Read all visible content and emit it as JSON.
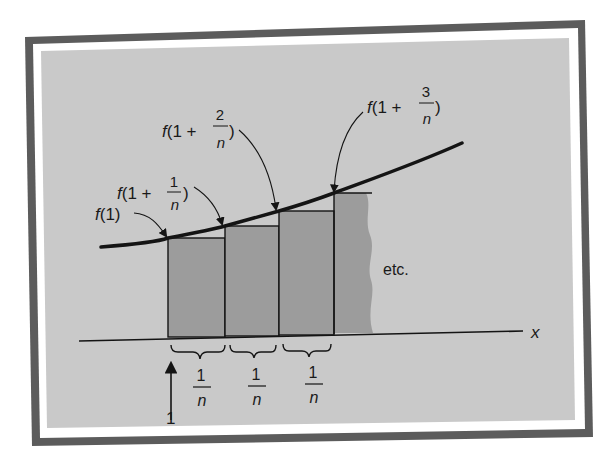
{
  "figure": {
    "colors": {
      "frame": "#5c5c5c",
      "mat": "#ffffff",
      "background": "#c9c9c9",
      "rect_fill": "#9c9c9c",
      "ink": "#141414"
    },
    "labels": {
      "f1": {
        "prefix": "f(1)"
      },
      "f1_plus_1n": {
        "prefix": "f(1 +",
        "num": "1",
        "den": "n",
        "suffix": ")"
      },
      "f1_plus_2n": {
        "prefix": "f(1 +",
        "num": "2",
        "den": "n",
        "suffix": ")"
      },
      "f1_plus_3n": {
        "prefix": "f(1 +",
        "num": "3",
        "den": "n",
        "suffix": ")"
      },
      "etc": "etc.",
      "x_axis": "x",
      "start": "1"
    },
    "widths": [
      {
        "num": "1",
        "den": "n"
      },
      {
        "num": "1",
        "den": "n"
      },
      {
        "num": "1",
        "den": "n"
      }
    ]
  }
}
